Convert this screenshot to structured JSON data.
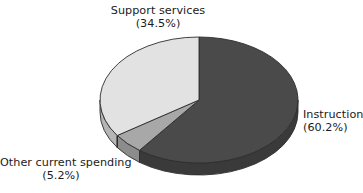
{
  "chart_data": {
    "type": "pie",
    "title": "",
    "subtitle": "",
    "xlabel": "",
    "ylabel": "",
    "legend_position": "none",
    "grid": false,
    "three_d": true,
    "start_angle_deg": 0,
    "direction": "clockwise",
    "categories": [
      "Instruction",
      "Other current spending",
      "Support services"
    ],
    "values": [
      60.2,
      5.2,
      34.5
    ],
    "value_unit": "%",
    "slices": [
      {
        "name": "Instruction",
        "label": "Instruction",
        "value": 60.2,
        "value_text": "(60.2%)",
        "color": "#4a4a4a",
        "side_color": "#3a3a3a"
      },
      {
        "name": "Other current spending",
        "label": "Other current spending",
        "value": 5.2,
        "value_text": "(5.2%)",
        "color": "#a8a8a8",
        "side_color": "#8c8c8c"
      },
      {
        "name": "Support services",
        "label": "Support services",
        "value": 34.5,
        "value_text": "(34.5%)",
        "color": "#e2e2e2",
        "side_color": "#b5b5b5"
      }
    ],
    "annotations": []
  },
  "labels": {
    "support": {
      "name": "Support services",
      "percent": "(34.5%)"
    },
    "instruction": {
      "name": "Instruction",
      "percent": "(60.2%)"
    },
    "other": {
      "name": "Other current spending",
      "percent": "(5.2%)"
    }
  },
  "colors": {
    "background": "#ffffff",
    "text": "#1b1b1b",
    "outline": "#2e2e2e",
    "instruction": "#4a4a4a",
    "other_current_spending": "#a8a8a8",
    "support_services": "#e2e2e2"
  },
  "geometry": {
    "center_x": 199,
    "center_y": 100,
    "radius_x": 99,
    "radius_y": 63,
    "depth": 12
  }
}
